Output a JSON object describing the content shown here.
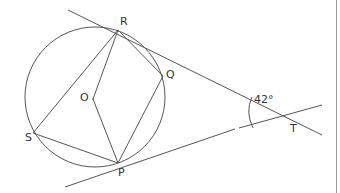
{
  "figure": {
    "points": {
      "R": {
        "label": "R",
        "x": 118,
        "y": 30
      },
      "Q": {
        "label": "Q",
        "x": 163,
        "y": 76
      },
      "O": {
        "label": "O",
        "x": 102,
        "y": 97
      },
      "S": {
        "label": "S",
        "x": 33,
        "y": 133
      },
      "P": {
        "label": "P",
        "x": 118,
        "y": 163
      },
      "T": {
        "label": "T",
        "x": 296,
        "y": 119
      }
    },
    "circle": {
      "cx": 95,
      "cy": 97,
      "r": 70
    },
    "angle_label": "42°",
    "stroke_color": "#555555",
    "label_color": "#333333"
  },
  "labels": {
    "R": "R",
    "Q": "Q",
    "O": "O",
    "S": "S",
    "P": "P",
    "T": "T",
    "angle": "42°"
  }
}
